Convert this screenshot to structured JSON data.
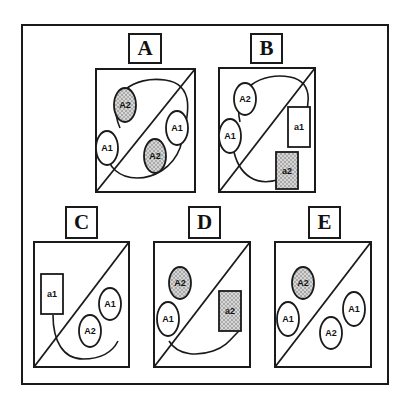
{
  "figure": {
    "outer_frame": {
      "x": 21,
      "y": 24,
      "w": 368,
      "h": 361
    },
    "stroke_color": "#1a1a1a",
    "stipple_color": "#9a9a9a",
    "panels": [
      {
        "id": "A",
        "label": "A",
        "label_box": {
          "x": 128,
          "y": 33,
          "w": 34,
          "h": 31
        },
        "box": {
          "x": 95,
          "y": 68,
          "w": 101,
          "h": 125
        },
        "loop_path": "M 25 60 C 10 25, 40 8, 70 12 C 100 16, 95 45, 85 80 C 70 120, 10 120, 12 80",
        "shapes": [
          {
            "type": "ellipse",
            "cx": 30,
            "cy": 37,
            "rx": 11,
            "ry": 17,
            "label": "A2",
            "shaded": true
          },
          {
            "type": "ellipse",
            "cx": 12,
            "cy": 80,
            "rx": 11,
            "ry": 17,
            "label": "A1",
            "shaded": false
          },
          {
            "type": "ellipse",
            "cx": 82,
            "cy": 60,
            "rx": 11,
            "ry": 17,
            "label": "A1",
            "shaded": false
          },
          {
            "type": "ellipse",
            "cx": 60,
            "cy": 88,
            "rx": 11,
            "ry": 17,
            "label": "A2",
            "shaded": true
          }
        ]
      },
      {
        "id": "B",
        "label": "B",
        "label_box": {
          "x": 250,
          "y": 33,
          "w": 33,
          "h": 31
        },
        "box": {
          "x": 218,
          "y": 67,
          "w": 98,
          "h": 126
        },
        "loop_path": "M 22 55 C 14 20, 45 5, 72 10 C 98 15, 92 45, 80 60 M 62 112 C 40 120, 20 110, 15 80",
        "shapes": [
          {
            "type": "ellipse",
            "cx": 27,
            "cy": 32,
            "rx": 11,
            "ry": 16,
            "label": "A2",
            "shaded": false
          },
          {
            "type": "ellipse",
            "cx": 12,
            "cy": 69,
            "rx": 11,
            "ry": 17,
            "label": "A1",
            "shaded": false
          },
          {
            "type": "rect",
            "x": 70,
            "y": 40,
            "w": 22,
            "h": 40,
            "label": "a1",
            "shaded": false
          },
          {
            "type": "rect",
            "x": 58,
            "y": 85,
            "w": 22,
            "h": 37,
            "label": "a2",
            "shaded": true
          }
        ]
      },
      {
        "id": "C",
        "label": "C",
        "label_box": {
          "x": 65,
          "y": 206,
          "w": 33,
          "h": 33
        },
        "box": {
          "x": 33,
          "y": 241,
          "w": 97,
          "h": 127
        },
        "loop_path": "M 20 74 C 20 100, 30 118, 50 118 C 70 118, 80 110, 85 100",
        "shapes": [
          {
            "type": "rect",
            "x": 8,
            "y": 33,
            "w": 22,
            "h": 40,
            "label": "a1",
            "shaded": false
          },
          {
            "type": "ellipse",
            "cx": 77,
            "cy": 63,
            "rx": 11,
            "ry": 16,
            "label": "A1",
            "shaded": false
          },
          {
            "type": "ellipse",
            "cx": 57,
            "cy": 90,
            "rx": 11,
            "ry": 16,
            "label": "A2",
            "shaded": false
          }
        ]
      },
      {
        "id": "D",
        "label": "D",
        "label_box": {
          "x": 188,
          "y": 206,
          "w": 33,
          "h": 33
        },
        "box": {
          "x": 153,
          "y": 241,
          "w": 98,
          "h": 127
        },
        "loop_path": "M 16 100 C 25 115, 45 115, 60 110 C 75 105, 80 95, 86 90",
        "shapes": [
          {
            "type": "ellipse",
            "cx": 27,
            "cy": 42,
            "rx": 11,
            "ry": 16,
            "label": "A2",
            "shaded": true
          },
          {
            "type": "ellipse",
            "cx": 15,
            "cy": 78,
            "rx": 11,
            "ry": 17,
            "label": "A1",
            "shaded": false
          },
          {
            "type": "rect",
            "x": 66,
            "y": 50,
            "w": 22,
            "h": 40,
            "label": "a2",
            "shaded": true
          }
        ]
      },
      {
        "id": "E",
        "label": "E",
        "label_box": {
          "x": 308,
          "y": 206,
          "w": 33,
          "h": 33
        },
        "box": {
          "x": 274,
          "y": 241,
          "w": 98,
          "h": 127
        },
        "loop_path": "",
        "shapes": [
          {
            "type": "ellipse",
            "cx": 29,
            "cy": 42,
            "rx": 11,
            "ry": 16,
            "label": "A2",
            "shaded": true
          },
          {
            "type": "ellipse",
            "cx": 14,
            "cy": 78,
            "rx": 11,
            "ry": 17,
            "label": "A1",
            "shaded": false
          },
          {
            "type": "ellipse",
            "cx": 80,
            "cy": 68,
            "rx": 11,
            "ry": 17,
            "label": "A1",
            "shaded": false
          },
          {
            "type": "ellipse",
            "cx": 57,
            "cy": 92,
            "rx": 11,
            "ry": 16,
            "label": "A2",
            "shaded": false
          }
        ]
      }
    ]
  }
}
